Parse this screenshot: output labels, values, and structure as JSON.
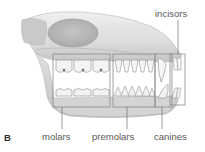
{
  "figure": {
    "panel_letter": "B"
  },
  "labels": {
    "incisors": "incisors",
    "molars": "molars",
    "premolars": "premolars",
    "canines": "canines"
  },
  "colors": {
    "bone_light": "#e6e6e6",
    "bone_mid": "#c8c8c8",
    "bone_dark": "#a8a8a8",
    "box_stroke": "#8a8a8a",
    "label_text": "#5a5a5a"
  }
}
